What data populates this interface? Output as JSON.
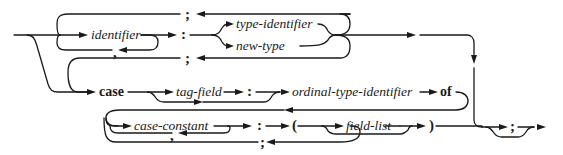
{
  "diagram": {
    "type": "syntax-diagram",
    "nodes": {
      "identifier": "identifier",
      "comma1": ",",
      "colon1": ":",
      "semicolon_top": ";",
      "type_identifier": "type-identifier",
      "new_type": "new-type",
      "semicolon_mid": ";",
      "case_kw": "case",
      "tag_field": "tag-field",
      "colon2": ":",
      "ordinal_type_identifier": "ordinal-type-identifier",
      "of_kw": "of",
      "case_constant": "case-constant",
      "comma2": ",",
      "colon3": ":",
      "lparen": "(",
      "field_list": "field-list",
      "rparen": ")",
      "semicolon_bottom": ";",
      "semicolon_end": ";"
    },
    "edges": [
      {
        "from": "entry",
        "to": "identifier"
      },
      {
        "from": "identifier",
        "to": "colon1"
      },
      {
        "from": "identifier",
        "to": "comma1",
        "loop": true
      },
      {
        "from": "colon1",
        "to": "type_identifier"
      },
      {
        "from": "colon1",
        "to": "new_type"
      },
      {
        "from": "type_identifier",
        "to": "semicolon_top",
        "loop": true
      },
      {
        "from": "new_type",
        "to": "semicolon_mid",
        "loop": true
      },
      {
        "from": "entry",
        "to": "case_kw"
      },
      {
        "from": "case_kw",
        "to": "tag_field"
      },
      {
        "from": "case_kw",
        "to": "colon2",
        "bypass": true
      },
      {
        "from": "tag_field",
        "to": "colon2"
      },
      {
        "from": "colon2",
        "to": "ordinal_type_identifier"
      },
      {
        "from": "ordinal_type_identifier",
        "to": "of_kw"
      },
      {
        "from": "of_kw",
        "to": "case_constant"
      },
      {
        "from": "case_constant",
        "to": "comma2",
        "loop": true
      },
      {
        "from": "case_constant",
        "to": "colon3"
      },
      {
        "from": "colon3",
        "to": "lparen"
      },
      {
        "from": "lparen",
        "to": "field_list"
      },
      {
        "from": "lparen",
        "to": "rparen",
        "bypass": true
      },
      {
        "from": "field_list",
        "to": "rparen"
      },
      {
        "from": "rparen",
        "to": "semicolon_bottom",
        "loop": true
      },
      {
        "from": "rparen",
        "to": "semicolon_end"
      },
      {
        "from": "rparen",
        "to": "exit",
        "bypass": true
      }
    ],
    "colors": {
      "line": "#1a1a1a",
      "background": "#ffffff"
    }
  }
}
